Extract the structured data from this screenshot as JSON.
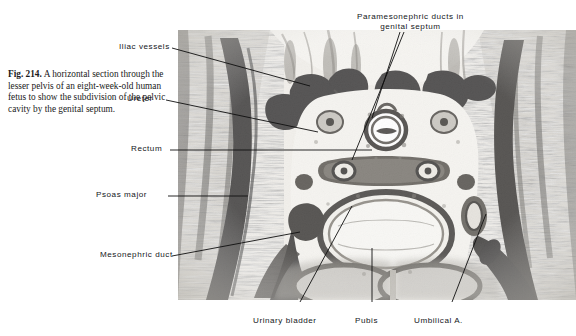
{
  "figure": {
    "number_label": "Fig. 214.",
    "caption_text": "A horizontal section through the lesser pelvis of an eight-week-old human fetus to show the subdivision of the pelvic cavity by the genital septum."
  },
  "photo": {
    "kind": "histological-section-photomicrograph",
    "subject": "horizontal section of lesser pelvis, eight-week-old human fetus",
    "tone": "grayscale"
  },
  "labels": {
    "iliac_vessels": "Iliac vessels",
    "ureter": "Ureter",
    "rectum": "Rectum",
    "psoas_major": "Psoas major",
    "mesonephric_duct": "Mesonephric duct",
    "paramesonephric_line1": "Paramesonephric ducts in",
    "paramesonephric_line2": "genital septum",
    "urinary_bladder": "Urinary bladder",
    "pubis": "Pubis",
    "umbilical_artery": "Umbilical A."
  },
  "colors": {
    "page_background": "#ffffff",
    "text": "#14161a",
    "caption_text": "#1a1a1a",
    "leader_line": "#101010",
    "tissue_dark": "#14120f",
    "tissue_mid": "#8a8780",
    "tissue_light": "#e9e7e1"
  }
}
